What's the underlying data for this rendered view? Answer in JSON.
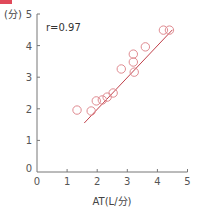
{
  "header": {
    "marker_color": "#e0495a",
    "text": ""
  },
  "chart_data": {
    "type": "scatter",
    "title": "",
    "xlabel": "AT(L/分)",
    "ylabel": "(分)",
    "xlim": [
      0,
      5
    ],
    "ylim": [
      0,
      5
    ],
    "x_ticks": [
      "0",
      "1",
      "2",
      "3",
      "4",
      "5"
    ],
    "y_ticks": [
      "0",
      "1",
      "2",
      "3",
      "4",
      "5"
    ],
    "grid": false,
    "legend": null,
    "annotation": "r=0.97",
    "marker": "open-circle",
    "marker_color": "#e08a90",
    "line_color": "#c0404a",
    "points": [
      {
        "x": 1.33,
        "y": 1.96
      },
      {
        "x": 1.8,
        "y": 1.93
      },
      {
        "x": 1.97,
        "y": 2.25
      },
      {
        "x": 2.17,
        "y": 2.28
      },
      {
        "x": 2.33,
        "y": 2.37
      },
      {
        "x": 2.53,
        "y": 2.5
      },
      {
        "x": 2.8,
        "y": 3.26
      },
      {
        "x": 3.23,
        "y": 3.16
      },
      {
        "x": 3.2,
        "y": 3.48
      },
      {
        "x": 3.2,
        "y": 3.73
      },
      {
        "x": 3.6,
        "y": 3.96
      },
      {
        "x": 4.2,
        "y": 4.49
      },
      {
        "x": 4.4,
        "y": 4.49
      }
    ],
    "regression_line": {
      "x1": 1.57,
      "y1": 1.55,
      "x2": 4.5,
      "y2": 4.5
    }
  }
}
